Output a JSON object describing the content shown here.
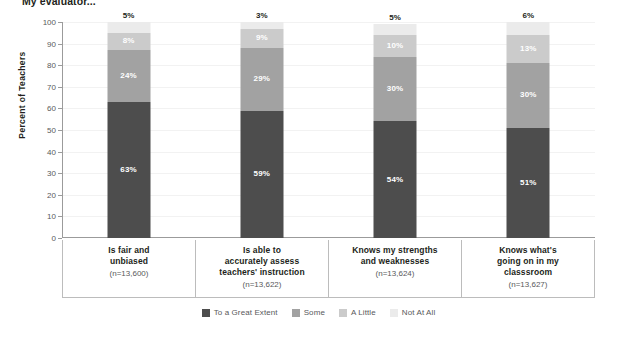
{
  "chart_data": {
    "type": "bar",
    "subtype": "stacked-bar-100",
    "title": "My evaluator...",
    "xlabel": "",
    "ylabel": "Percent of Teachers",
    "ylim": [
      0,
      100
    ],
    "ytick_step": 10,
    "yticks": [
      "100",
      "90",
      "80",
      "70",
      "60",
      "50",
      "40",
      "30",
      "20",
      "10",
      "0"
    ],
    "grid": true,
    "legend_position": "bottom",
    "categories": [
      "Is fair and\nunbiased",
      "Is able to\naccurately assess\nteachers' instruction",
      "Knows my strengths\nand weaknesses",
      "Knows what's\ngoing on in my\nclasssroom"
    ],
    "category_n": [
      "(n=13,600)",
      "(n=13,622)",
      "(n=13,624)",
      "(n=13,627)"
    ],
    "series": [
      {
        "name": "To a Great Extent",
        "color": "#4d4d4d",
        "values": [
          63,
          59,
          54,
          51
        ],
        "labels": [
          "63%",
          "59%",
          "54%",
          "51%"
        ]
      },
      {
        "name": "Some",
        "color": "#a2a2a2",
        "values": [
          24,
          29,
          30,
          30
        ],
        "labels": [
          "24%",
          "29%",
          "30%",
          "30%"
        ]
      },
      {
        "name": "A Little",
        "color": "#cbcbcb",
        "values": [
          8,
          9,
          10,
          13
        ],
        "labels": [
          "8%",
          "9%",
          "10%",
          "13%"
        ]
      },
      {
        "name": "Not At All",
        "color": "#ebebeb",
        "values": [
          5,
          3,
          5,
          6
        ],
        "labels": [
          "5%",
          "3%",
          "5%",
          "6%"
        ]
      }
    ]
  },
  "legend": {
    "items": [
      {
        "label": "To a Great Extent",
        "color": "#4d4d4d"
      },
      {
        "label": "Some",
        "color": "#a2a2a2"
      },
      {
        "label": "A Little",
        "color": "#cbcbcb"
      },
      {
        "label": "Not At All",
        "color": "#ebebeb"
      }
    ]
  }
}
